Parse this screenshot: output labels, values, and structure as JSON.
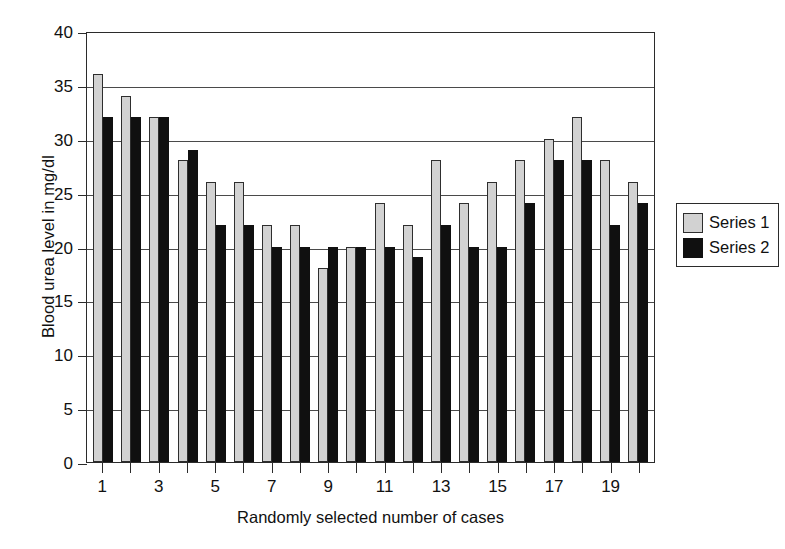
{
  "chart_data": {
    "type": "bar",
    "title": "",
    "xlabel": "Randomly selected number of cases",
    "ylabel": "Blood urea level in mg/dl",
    "categories": [
      "1",
      "2",
      "3",
      "4",
      "5",
      "6",
      "7",
      "8",
      "9",
      "10",
      "11",
      "12",
      "13",
      "14",
      "15",
      "16",
      "17",
      "18",
      "19",
      "20"
    ],
    "x_tick_labels": [
      "1",
      "",
      "3",
      "",
      "5",
      "",
      "7",
      "",
      "9",
      "",
      "11",
      "",
      "13",
      "",
      "15",
      "",
      "17",
      "",
      "19",
      ""
    ],
    "series": [
      {
        "name": "Series 1",
        "color": "#d2d2d2",
        "values": [
          36,
          34,
          32,
          28,
          26,
          26,
          22,
          22,
          18,
          20,
          24,
          22,
          28,
          24,
          26,
          28,
          30,
          32,
          28,
          26
        ]
      },
      {
        "name": "Series 2",
        "color": "#101010",
        "values": [
          32,
          32,
          32,
          29,
          22,
          22,
          20,
          20,
          20,
          20,
          20,
          19,
          22,
          20,
          20,
          24,
          28,
          28,
          22,
          24
        ]
      }
    ],
    "ylim": [
      0,
      40
    ],
    "y_ticks": [
      0,
      5,
      10,
      15,
      20,
      25,
      30,
      35,
      40
    ],
    "grid": "horizontal",
    "legend_position": "right",
    "legend_entries": [
      "Series 1",
      "Series 2"
    ]
  },
  "legend": {
    "series1_label": "Series 1",
    "series2_label": "Series 2"
  }
}
